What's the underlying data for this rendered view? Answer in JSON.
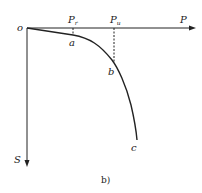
{
  "diagram": {
    "origin_label": "o",
    "x_axis_label": "P",
    "y_axis_label": "S",
    "caption": "b)",
    "markers": [
      {
        "label": "P",
        "sub": "r",
        "point": "a"
      },
      {
        "label": "P",
        "sub": "u",
        "point": "b"
      }
    ],
    "points": {
      "a": "a",
      "b": "b",
      "c": "c"
    },
    "colors": {
      "line": "#222222",
      "background": "#ffffff"
    }
  }
}
